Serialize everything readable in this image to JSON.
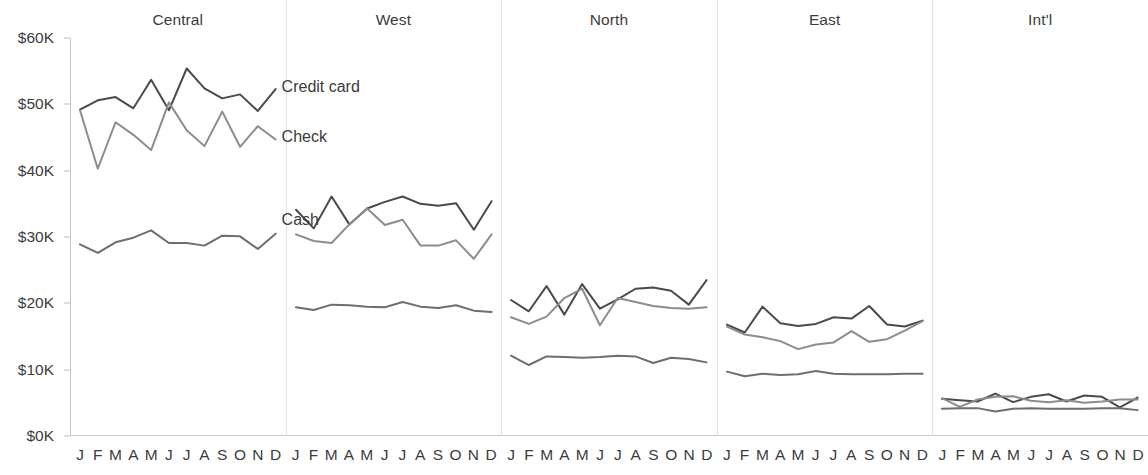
{
  "chart_data": {
    "type": "line",
    "title": "",
    "subtitle": "",
    "xlabel": "",
    "ylabel": "",
    "ylim": [
      0,
      60000
    ],
    "y_ticks": [
      0,
      10000,
      20000,
      30000,
      40000,
      50000,
      60000
    ],
    "y_tick_labels": [
      "$0K",
      "$10K",
      "$20K",
      "$30K",
      "$40K",
      "$50K",
      "$60K"
    ],
    "grid": false,
    "legend_position": "inline-annotation",
    "facet_by": "Region",
    "x": [
      "J",
      "F",
      "M",
      "A",
      "M",
      "J",
      "J",
      "A",
      "S",
      "O",
      "N",
      "D"
    ],
    "x_full": [
      "January",
      "February",
      "March",
      "April",
      "May",
      "June",
      "July",
      "August",
      "September",
      "October",
      "November",
      "December"
    ],
    "panels": [
      {
        "name": "Central",
        "series": [
          {
            "name": "Credit card",
            "color": "#4a4a4a",
            "values": [
              49200,
              50600,
              51100,
              49400,
              53700,
              49100,
              55400,
              52400,
              50900,
              51500,
              49000,
              52300
            ]
          },
          {
            "name": "Check",
            "color": "#8c8c8c",
            "values": [
              49100,
              40300,
              47300,
              45400,
              43100,
              50300,
              46100,
              43700,
              48900,
              43600,
              46700,
              44700
            ]
          },
          {
            "name": "Cash",
            "color": "#6e6e6e",
            "values": [
              28900,
              27600,
              29200,
              29900,
              31000,
              29100,
              29100,
              28700,
              30200,
              30100,
              28200,
              30500
            ]
          }
        ]
      },
      {
        "name": "West",
        "series": [
          {
            "name": "Credit card",
            "color": "#4a4a4a",
            "values": [
              34100,
              31300,
              36100,
              31900,
              34300,
              35300,
              36100,
              35000,
              34700,
              35100,
              31100,
              35400
            ]
          },
          {
            "name": "Check",
            "color": "#8c8c8c",
            "values": [
              30400,
              29400,
              29100,
              31900,
              34300,
              31800,
              32600,
              28700,
              28700,
              29500,
              26700,
              30400
            ]
          },
          {
            "name": "Cash",
            "color": "#6e6e6e",
            "values": [
              19400,
              19000,
              19800,
              19700,
              19500,
              19400,
              20200,
              19500,
              19300,
              19700,
              18900,
              18700
            ]
          }
        ]
      },
      {
        "name": "North",
        "series": [
          {
            "name": "Credit card",
            "color": "#4a4a4a",
            "values": [
              20500,
              18800,
              22600,
              18300,
              22900,
              19200,
              20600,
              22200,
              22400,
              21900,
              19800,
              23500
            ]
          },
          {
            "name": "Check",
            "color": "#8c8c8c",
            "values": [
              17900,
              16900,
              18000,
              20800,
              22200,
              16700,
              20800,
              20200,
              19600,
              19300,
              19200,
              19400
            ]
          },
          {
            "name": "Cash",
            "color": "#6e6e6e",
            "values": [
              12100,
              10700,
              12000,
              11900,
              11800,
              11900,
              12100,
              12000,
              11000,
              11800,
              11600,
              11100
            ]
          }
        ]
      },
      {
        "name": "East",
        "series": [
          {
            "name": "Credit card",
            "color": "#4a4a4a",
            "values": [
              16800,
              15600,
              19500,
              17000,
              16600,
              16900,
              17900,
              17700,
              19600,
              16800,
              16500,
              17400
            ]
          },
          {
            "name": "Check",
            "color": "#8c8c8c",
            "values": [
              16500,
              15300,
              14900,
              14300,
              13100,
              13800,
              14100,
              15800,
              14200,
              14600,
              15900,
              17300
            ]
          },
          {
            "name": "Cash",
            "color": "#6e6e6e",
            "values": [
              9700,
              9000,
              9400,
              9200,
              9300,
              9800,
              9400,
              9300,
              9300,
              9300,
              9400,
              9400
            ]
          }
        ]
      },
      {
        "name": "Int'l",
        "series": [
          {
            "name": "Credit card",
            "color": "#4a4a4a",
            "values": [
              5600,
              5400,
              5200,
              6400,
              5100,
              5900,
              6300,
              5200,
              6100,
              5900,
              4300,
              5800
            ]
          },
          {
            "name": "Check",
            "color": "#8c8c8c",
            "values": [
              5700,
              4400,
              5500,
              5900,
              6000,
              5300,
              5100,
              5400,
              5000,
              5200,
              5500,
              5500
            ]
          },
          {
            "name": "Cash",
            "color": "#6e6e6e",
            "values": [
              4100,
              4200,
              4200,
              3700,
              4100,
              4200,
              4100,
              4100,
              4100,
              4200,
              4200,
              3900
            ]
          }
        ]
      }
    ],
    "annotations": [
      {
        "text": "Credit card",
        "panel": "Central",
        "series": "Credit card"
      },
      {
        "text": "Check",
        "panel": "Central",
        "series": "Check"
      },
      {
        "text": "Cash",
        "panel": "Central",
        "series": "Cash"
      }
    ]
  }
}
